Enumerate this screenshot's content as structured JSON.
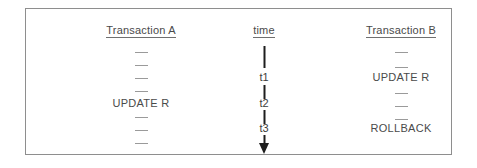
{
  "figure": {
    "caption_kind": "transaction-timeline-diagram",
    "colors": {
      "frame": "#8e8e8e",
      "text": "#4a4a4a",
      "axis": "#1e1e1e",
      "dash": "#9a9a9a",
      "background": "#ffffff"
    }
  },
  "columns": {
    "left": {
      "heading": "Transaction A",
      "rows": [
        {
          "type": "dash",
          "label": "—"
        },
        {
          "type": "dash",
          "label": "—"
        },
        {
          "type": "dash",
          "label": "—"
        },
        {
          "type": "dash",
          "label": "—"
        },
        {
          "type": "text",
          "label": "UPDATE R"
        },
        {
          "type": "dash",
          "label": "—"
        },
        {
          "type": "dash",
          "label": "—"
        },
        {
          "type": "dash",
          "label": "—"
        }
      ]
    },
    "middle": {
      "heading": "time",
      "ticks": [
        {
          "label": "t1"
        },
        {
          "label": "t2"
        },
        {
          "label": "t3"
        }
      ],
      "arrow_direction": "down"
    },
    "right": {
      "heading": "Transaction B",
      "rows": [
        {
          "type": "dash",
          "label": "—"
        },
        {
          "type": "dash",
          "label": "—"
        },
        {
          "type": "text",
          "label": "UPDATE R"
        },
        {
          "type": "dash",
          "label": "—"
        },
        {
          "type": "dash",
          "label": "—"
        },
        {
          "type": "dash",
          "label": "—"
        },
        {
          "type": "text",
          "label": "ROLLBACK"
        }
      ]
    }
  }
}
